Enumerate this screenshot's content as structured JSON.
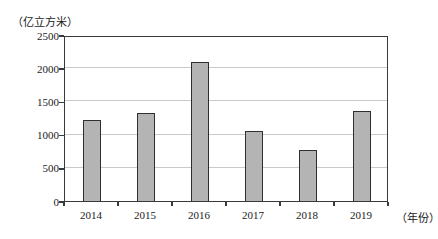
{
  "chart_data": {
    "type": "bar",
    "title": "",
    "y_unit": "（亿立方米）",
    "x_unit": "（年份）",
    "categories": [
      "2014",
      "2015",
      "2016",
      "2017",
      "2018",
      "2019"
    ],
    "values": [
      1220,
      1320,
      2100,
      1050,
      770,
      1360
    ],
    "ylim": [
      0,
      2500
    ],
    "yticks": [
      0,
      500,
      1000,
      1500,
      2000,
      2500
    ],
    "grid": true,
    "legend": false,
    "bar_color": "#b4b4b4",
    "bar_border_color": "#2f2f2f",
    "gridline_color": "#c9c9c9",
    "axis_color": "#3a3a3a"
  }
}
